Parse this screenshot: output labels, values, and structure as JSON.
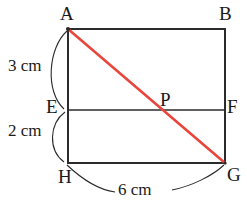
{
  "figure": {
    "background_color": "#ffffff",
    "stroke_color": "#2b2b2b",
    "diagonal_color": "#e8463c",
    "vertices": [
      {
        "id": "A",
        "label": "A",
        "x": 68,
        "y": 29
      },
      {
        "id": "B",
        "label": "B",
        "x": 225,
        "y": 29
      },
      {
        "id": "E",
        "label": "E",
        "x": 68,
        "y": 110
      },
      {
        "id": "F",
        "label": "F",
        "x": 225,
        "y": 110
      },
      {
        "id": "P",
        "label": "P",
        "x": 163,
        "y": 110
      },
      {
        "id": "H",
        "label": "H",
        "x": 68,
        "y": 163
      },
      {
        "id": "G",
        "label": "G",
        "x": 225,
        "y": 163
      }
    ],
    "measures": [
      {
        "id": "AE",
        "label": "3 cm",
        "value": 3,
        "unit": "cm",
        "segment": "A-E",
        "side": "left"
      },
      {
        "id": "EH",
        "label": "2 cm",
        "value": 2,
        "unit": "cm",
        "segment": "E-H",
        "side": "left"
      },
      {
        "id": "HG",
        "label": "6 cm",
        "value": 6,
        "unit": "cm",
        "segment": "H-G",
        "side": "bottom"
      }
    ],
    "segments": {
      "top": "A-B",
      "left": "A-H",
      "right": "B-G",
      "bottom": "H-G",
      "divider": "E-F",
      "diagonal": "A-G"
    }
  }
}
